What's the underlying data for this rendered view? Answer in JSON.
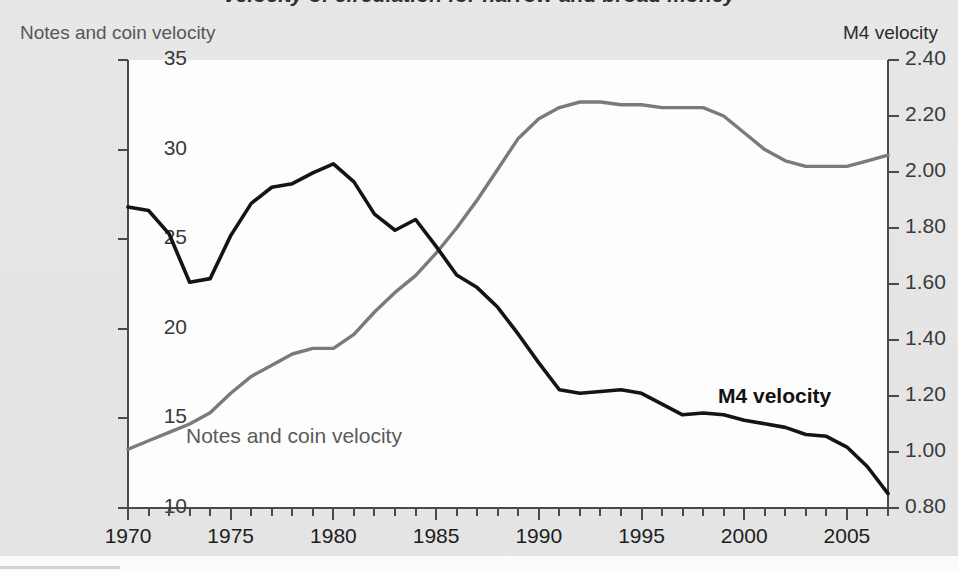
{
  "figure": {
    "title": "Velocity of circulation for narrow and broad money",
    "left_axis_label": "Notes and coin velocity",
    "right_axis_label": "M4 velocity",
    "inline_labels": {
      "notes": "Notes and coin velocity",
      "m4": "M4 velocity"
    },
    "colors": {
      "notes_and_coin_line": "#7a7a7a",
      "m4_line": "#141414",
      "page_background": "#e8e8e8",
      "plot_background": "#fdfdfd",
      "axis": "#4a4a4a"
    }
  },
  "chart_data": {
    "type": "line",
    "title": "Velocity of circulation for narrow and broad money",
    "xlabel": "",
    "ylabel": "Notes and coin velocity",
    "y2label": "M4 velocity",
    "xlim": [
      1970,
      2007
    ],
    "ylim": [
      10,
      35
    ],
    "y2lim": [
      0.8,
      2.4
    ],
    "grid": false,
    "legend": "inline-annotations",
    "x_ticks_major": [
      1970,
      1975,
      1980,
      1985,
      1990,
      1995,
      2000,
      2005
    ],
    "x_ticks_minor_step": 1,
    "y_ticks_left": [
      10,
      15,
      20,
      25,
      30,
      35
    ],
    "y_ticks_right": [
      "0.80",
      "1.00",
      "1.20",
      "1.40",
      "1.60",
      "1.80",
      "2.00",
      "2.20",
      "2.40"
    ],
    "x": [
      1970,
      1971,
      1972,
      1973,
      1974,
      1975,
      1976,
      1977,
      1978,
      1979,
      1980,
      1981,
      1982,
      1983,
      1984,
      1985,
      1986,
      1987,
      1988,
      1989,
      1990,
      1991,
      1992,
      1993,
      1994,
      1995,
      1996,
      1997,
      1998,
      1999,
      2000,
      2001,
      2002,
      2003,
      2004,
      2005,
      2006,
      2007
    ],
    "series": [
      {
        "name": "M4 velocity",
        "axis": "left",
        "units": "Notes and coin velocity (ratio)",
        "color": "#141414",
        "values": [
          26.8,
          26.6,
          25.3,
          22.6,
          22.8,
          25.2,
          27.0,
          27.9,
          28.1,
          28.7,
          29.2,
          28.2,
          26.4,
          25.5,
          26.1,
          24.6,
          23.0,
          22.3,
          21.2,
          19.7,
          18.1,
          16.6,
          16.4,
          16.5,
          16.6,
          16.4,
          15.8,
          15.2,
          15.3,
          15.2,
          14.9,
          14.7,
          14.5,
          14.1,
          14.0,
          13.4,
          12.3,
          10.8
        ]
      },
      {
        "name": "Notes and coin velocity",
        "axis": "right",
        "units": "M4 velocity (ratio)",
        "color": "#7a7a7a",
        "values": [
          1.01,
          1.04,
          1.07,
          1.1,
          1.14,
          1.21,
          1.27,
          1.31,
          1.35,
          1.37,
          1.37,
          1.42,
          1.5,
          1.57,
          1.63,
          1.71,
          1.8,
          1.9,
          2.01,
          2.12,
          2.19,
          2.23,
          2.25,
          2.25,
          2.24,
          2.24,
          2.23,
          2.23,
          2.23,
          2.2,
          2.14,
          2.08,
          2.04,
          2.02,
          2.02,
          2.02,
          2.04,
          2.06
        ]
      }
    ]
  }
}
